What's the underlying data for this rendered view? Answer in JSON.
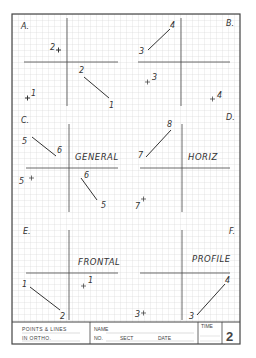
{
  "sheet": {
    "colors": {
      "grid": "#cfcfcf",
      "ink": "#333333",
      "border": "#444444",
      "paper": "#ffffff"
    },
    "quadrants": [
      {
        "id": "A",
        "label": "A.",
        "title": ""
      },
      {
        "id": "B",
        "label": "B.",
        "title": ""
      },
      {
        "id": "C",
        "label": "C.",
        "title": "GENERAL"
      },
      {
        "id": "D",
        "label": "D.",
        "title": "HORIZ"
      },
      {
        "id": "E",
        "label": "E.",
        "title": "FRONTAL"
      },
      {
        "id": "F",
        "label": "F.",
        "title": "PROFILE"
      }
    ],
    "problem_labels": {
      "A": {
        "p_top": "2",
        "line_a": "2",
        "line_b": "1",
        "p_bot": "1"
      },
      "B": {
        "line_a": "3",
        "line_b": "4",
        "p_mid": "3",
        "p_bot": "4"
      },
      "C": {
        "line_a": "5",
        "line_b": "6",
        "p_left": "5",
        "line2_a": "6",
        "line2_b": "5"
      },
      "D": {
        "line_a": "7",
        "line_b": "8",
        "p_bot": "7"
      },
      "E": {
        "line_a": "1",
        "line_b": "2",
        "p_mid": "1"
      },
      "F": {
        "line_a": "3",
        "line_b": "4",
        "p_bot": "3"
      }
    }
  },
  "title_block": {
    "title_line1": "POINTS & LINES",
    "title_line2": "IN ORTHO.",
    "name_label": "NAME",
    "no_label": "NO.",
    "sect_label": "SECT",
    "date_label": "DATE",
    "time_label": "TIME",
    "sheet_number": "2"
  }
}
